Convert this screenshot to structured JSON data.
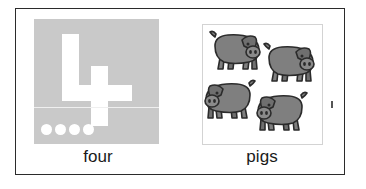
{
  "card": {
    "name": "number-word-flashcard",
    "border_color": "#2b2b2b",
    "background": "#ffffff"
  },
  "left_panel": {
    "name": "number-panel",
    "tile_color": "#c9c9c9",
    "digit": "4",
    "digit_color": "#ffffff",
    "caption": "four",
    "divider_color": "#efefef",
    "counting_dots": {
      "count": 4,
      "color": "#ffffff",
      "items": [
        "dot",
        "dot",
        "dot",
        "dot"
      ]
    }
  },
  "right_panel": {
    "name": "picture-panel",
    "frame_border_color": "#d3d3d3",
    "caption": "pigs",
    "subject": "pig",
    "body_color": "#7f7f7f",
    "outline_color": "#2b2b2b",
    "animals": [
      {
        "label": "pig",
        "facing": "right"
      },
      {
        "label": "pig",
        "facing": "right"
      },
      {
        "label": "pig",
        "facing": "left"
      },
      {
        "label": "pig",
        "facing": "left"
      }
    ],
    "animal_count": 4
  },
  "marks": {
    "stray_mark": "speck"
  }
}
